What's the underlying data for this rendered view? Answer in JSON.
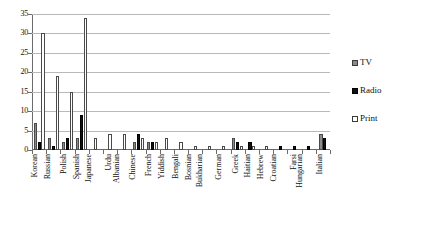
{
  "chart_data": {
    "type": "bar",
    "title": "",
    "xlabel": "",
    "ylabel": "",
    "ylim": [
      0,
      35
    ],
    "yticks": [
      0,
      5,
      10,
      15,
      20,
      25,
      30,
      35
    ],
    "ytick_labels": [
      "0",
      "5",
      "10",
      "15",
      "20",
      "25",
      "30",
      "35"
    ],
    "grid": true,
    "legend_position": "right",
    "categories": [
      "Korean",
      "Russian",
      "Polish",
      "Spanish",
      "Japanese",
      "Urdu",
      "Albanian",
      "Chinese",
      "French",
      "Yiddish",
      "Bengali",
      "Bosnian",
      "Bukharian",
      "German",
      "Greek",
      "Haitian",
      "Hebrew",
      "Croatian",
      "Farsi",
      "Hungarian",
      "Italian"
    ],
    "series": [
      {
        "name": "TV",
        "color": "#8a8a8a",
        "values": [
          7,
          3,
          2,
          3,
          0,
          0,
          0,
          2,
          2,
          0,
          0,
          0,
          0,
          0,
          3,
          0,
          0,
          0,
          0,
          0,
          4
        ]
      },
      {
        "name": "Radio",
        "color": "#111111",
        "values": [
          2,
          1,
          3,
          9,
          0,
          0,
          0,
          4,
          2,
          0,
          0,
          0,
          0,
          0,
          2,
          2,
          0,
          1,
          1,
          1,
          3
        ]
      },
      {
        "name": "Print",
        "color": "#ffffff",
        "values": [
          30,
          19,
          15,
          34,
          3,
          4,
          4,
          3,
          2,
          3,
          2,
          1,
          1,
          1,
          1,
          1,
          1,
          0,
          0,
          0,
          0
        ]
      }
    ]
  },
  "legend": {
    "items": [
      {
        "label": "TV",
        "swatch": "tv"
      },
      {
        "label": "Radio",
        "swatch": "radio"
      },
      {
        "label": "Print",
        "swatch": "print"
      }
    ]
  }
}
